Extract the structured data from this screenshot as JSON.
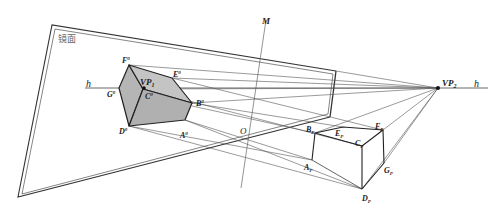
{
  "figure": {
    "caption_cut_off": "",
    "mirror_label": "镜面",
    "horizon_label_left": "h",
    "horizon_label_right": "h",
    "mirror_axis_label": "M",
    "origin_label": "O",
    "vanishing_points": [
      {
        "id": "vp1",
        "label": "VP",
        "sub": "1"
      },
      {
        "id": "vp2",
        "label": "VP",
        "sub": "2"
      }
    ],
    "reflected_box_labels": [
      {
        "id": "f0",
        "label": "F",
        "sup": "0"
      },
      {
        "id": "e0",
        "label": "E",
        "sup": "0"
      },
      {
        "id": "g0",
        "label": "G",
        "sup": "0"
      },
      {
        "id": "c0",
        "label": "C",
        "sup": "0"
      },
      {
        "id": "b0",
        "label": "B",
        "sup": "0"
      },
      {
        "id": "d0",
        "label": "D",
        "sup": "0"
      },
      {
        "id": "a0",
        "label": "A",
        "sup": "0"
      }
    ],
    "real_box_labels": [
      {
        "id": "bp",
        "label": "B",
        "sub": "P"
      },
      {
        "id": "ep",
        "label": "E",
        "sub": "P"
      },
      {
        "id": "fp",
        "label": "F",
        "sub": "P"
      },
      {
        "id": "cp",
        "label": "C",
        "sub": "P"
      },
      {
        "id": "ap",
        "label": "A",
        "sub": "P"
      },
      {
        "id": "gp",
        "label": "G",
        "sub": "P"
      },
      {
        "id": "dp",
        "label": "D",
        "sub": "P"
      }
    ],
    "colors": {
      "line": "#333333",
      "shade": "#b8b8b8",
      "thin_line": "#555555"
    }
  }
}
